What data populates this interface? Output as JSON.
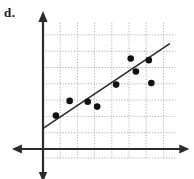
{
  "figure": {
    "part_label": "d."
  },
  "colors": {
    "axis": "#2b2b2b",
    "grid": "#9a9aa2",
    "point": "#111111",
    "trend": "#2b2b2b",
    "background": "#ffffff"
  },
  "chart_data": {
    "type": "scatter",
    "title": "",
    "xlabel": "",
    "ylabel": "",
    "xlim": [
      0,
      8
    ],
    "ylim": [
      0,
      8
    ],
    "grid": true,
    "legend": "none",
    "axis_ticks": {
      "x": [
        1,
        2,
        3,
        4,
        5,
        6,
        7
      ],
      "y": [
        1,
        2,
        3,
        4,
        5,
        6,
        7
      ]
    },
    "points": [
      {
        "x": 0.75,
        "y": 2.05
      },
      {
        "x": 1.55,
        "y": 2.95
      },
      {
        "x": 2.6,
        "y": 2.9
      },
      {
        "x": 3.15,
        "y": 2.6
      },
      {
        "x": 4.25,
        "y": 3.95
      },
      {
        "x": 5.1,
        "y": 5.55
      },
      {
        "x": 5.4,
        "y": 4.75
      },
      {
        "x": 6.15,
        "y": 5.45
      },
      {
        "x": 6.3,
        "y": 4.05
      }
    ],
    "trend_line": {
      "label": "line of best fit",
      "x_start": 0.05,
      "y_start": 1.3,
      "x_end": 7.35,
      "y_end": 6.45
    },
    "axes": {
      "x_axis_arrows": "both",
      "y_axis_arrows": "both",
      "origin_x_px": 43,
      "origin_y_px": 149
    }
  }
}
